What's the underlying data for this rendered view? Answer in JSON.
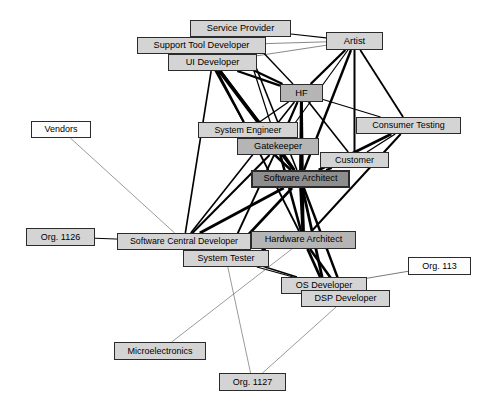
{
  "diagram": {
    "type": "node-link-network",
    "title": "",
    "width": 495,
    "height": 410,
    "background": "#ffffff",
    "styles": {
      "fill_white": "#fdfdfd",
      "fill_light_gray": "#d4d4d4",
      "fill_mid_gray": "#b5b5b5",
      "fill_dark_gray": "#8e8e8e",
      "border_color": "#2b2b2b",
      "edge_color": "#000000",
      "edge_thin_color": "#555555",
      "text_color": "#000000"
    },
    "nodes": [
      {
        "id": "service_provider",
        "label": "Service Provider",
        "x": 190,
        "y": 20,
        "w": 101,
        "h": 17,
        "fill": "#d4d4d4",
        "border": 1.6,
        "font": 9.2,
        "z": 24
      },
      {
        "id": "support_tool_dev",
        "label": "Support Tool Developer",
        "x": 137,
        "y": 37,
        "w": 129,
        "h": 17,
        "fill": "#d4d4d4",
        "border": 1.8,
        "font": 9.2,
        "z": 25
      },
      {
        "id": "artist",
        "label": "Artist",
        "x": 326,
        "y": 32,
        "w": 57,
        "h": 18,
        "fill": "#d4d4d4",
        "border": 1.8,
        "font": 9.4,
        "z": 26
      },
      {
        "id": "ui_developer",
        "label": "UI Developer",
        "x": 168,
        "y": 54,
        "w": 89,
        "h": 17,
        "fill": "#d4d4d4",
        "border": 1.8,
        "font": 9.2,
        "z": 27
      },
      {
        "id": "hf",
        "label": "HF",
        "x": 280,
        "y": 84,
        "w": 43,
        "h": 18,
        "fill": "#b5b5b5",
        "border": 1.8,
        "font": 9.4,
        "z": 28
      },
      {
        "id": "vendors",
        "label": "Vendors",
        "x": 31,
        "y": 121,
        "w": 60,
        "h": 17,
        "fill": "#fdfdfd",
        "border": 1.4,
        "font": 9.0,
        "z": 20
      },
      {
        "id": "system_engineer",
        "label": "System Engineer",
        "x": 198,
        "y": 122,
        "w": 100,
        "h": 16,
        "fill": "#d4d4d4",
        "border": 1.5,
        "font": 8.8,
        "z": 29
      },
      {
        "id": "consumer_testing",
        "label": "Consumer Testing",
        "x": 356,
        "y": 117,
        "w": 105,
        "h": 17,
        "fill": "#d4d4d4",
        "border": 1.6,
        "font": 9.0,
        "z": 30
      },
      {
        "id": "gatekeeper",
        "label": "Gatekeeper",
        "x": 237,
        "y": 138,
        "w": 82,
        "h": 17,
        "fill": "#b5b5b5",
        "border": 1.8,
        "font": 9.2,
        "z": 31
      },
      {
        "id": "customer",
        "label": "Customer",
        "x": 320,
        "y": 152,
        "w": 69,
        "h": 16,
        "fill": "#d4d4d4",
        "border": 1.5,
        "font": 9.0,
        "z": 32
      },
      {
        "id": "software_architect",
        "label": "Software Architect",
        "x": 251,
        "y": 170,
        "w": 99,
        "h": 18,
        "fill": "#8e8e8e",
        "border": 2.0,
        "font": 9.2,
        "z": 33
      },
      {
        "id": "org_1126",
        "label": "Org. 1126",
        "x": 26,
        "y": 228,
        "w": 69,
        "h": 18,
        "fill": "#d4d4d4",
        "border": 1.8,
        "font": 9.0,
        "z": 21
      },
      {
        "id": "sw_central_dev",
        "label": "Software Central Developer",
        "x": 117,
        "y": 233,
        "w": 134,
        "h": 17,
        "fill": "#d4d4d4",
        "border": 1.6,
        "font": 8.8,
        "z": 34
      },
      {
        "id": "hardware_architect",
        "label": "Hardware Architect",
        "x": 251,
        "y": 231,
        "w": 105,
        "h": 18,
        "fill": "#b5b5b5",
        "border": 1.8,
        "font": 9.2,
        "z": 35
      },
      {
        "id": "system_tester",
        "label": "System Tester",
        "x": 183,
        "y": 250,
        "w": 86,
        "h": 17,
        "fill": "#d4d4d4",
        "border": 1.6,
        "font": 9.0,
        "z": 36
      },
      {
        "id": "org_113",
        "label": "Org. 113",
        "x": 408,
        "y": 257,
        "w": 63,
        "h": 18,
        "fill": "#fdfdfd",
        "border": 1.6,
        "font": 9.0,
        "z": 22
      },
      {
        "id": "os_developer",
        "label": "OS Developer",
        "x": 281,
        "y": 277,
        "w": 86,
        "h": 17,
        "fill": "#d4d4d4",
        "border": 1.6,
        "font": 9.0,
        "z": 37
      },
      {
        "id": "dsp_developer",
        "label": "DSP Developer",
        "x": 301,
        "y": 290,
        "w": 89,
        "h": 17,
        "fill": "#d4d4d4",
        "border": 1.6,
        "font": 9.0,
        "z": 38
      },
      {
        "id": "microelectronics",
        "label": "Microelectronics",
        "x": 114,
        "y": 342,
        "w": 92,
        "h": 18,
        "fill": "#d4d4d4",
        "border": 1.6,
        "font": 9.0,
        "z": 23
      },
      {
        "id": "org_1127",
        "label": "Org. 1127",
        "x": 219,
        "y": 373,
        "w": 67,
        "h": 18,
        "fill": "#d4d4d4",
        "border": 1.8,
        "font": 9.0,
        "z": 23
      }
    ],
    "edges": [
      {
        "from": "support_tool_dev",
        "to": "artist",
        "weight": 0.7
      },
      {
        "from": "ui_developer",
        "to": "artist",
        "weight": 0.7
      },
      {
        "from": "service_provider",
        "to": "artist",
        "weight": 1.1
      },
      {
        "from": "support_tool_dev",
        "to": "hf",
        "weight": 2.2
      },
      {
        "from": "ui_developer",
        "to": "hf",
        "weight": 2.2
      },
      {
        "from": "service_provider",
        "to": "hf",
        "weight": 1.4
      },
      {
        "from": "artist",
        "to": "hf",
        "weight": 2.4
      },
      {
        "from": "artist",
        "to": "consumer_testing",
        "weight": 1.8
      },
      {
        "from": "artist",
        "to": "customer",
        "weight": 2.0
      },
      {
        "from": "artist",
        "to": "software_architect",
        "weight": 2.4
      },
      {
        "from": "artist",
        "to": "gatekeeper",
        "weight": 1.2
      },
      {
        "from": "hf",
        "to": "consumer_testing",
        "weight": 1.2
      },
      {
        "from": "hf",
        "to": "customer",
        "weight": 1.6
      },
      {
        "from": "hf",
        "to": "system_engineer",
        "weight": 1.4
      },
      {
        "from": "hf",
        "to": "gatekeeper",
        "weight": 2.2
      },
      {
        "from": "hf",
        "to": "software_architect",
        "weight": 3.0
      },
      {
        "from": "hf",
        "to": "hardware_architect",
        "weight": 2.4
      },
      {
        "from": "hf",
        "to": "sw_central_dev",
        "weight": 1.6
      },
      {
        "from": "ui_developer",
        "to": "system_engineer",
        "weight": 2.2
      },
      {
        "from": "ui_developer",
        "to": "gatekeeper",
        "weight": 2.4
      },
      {
        "from": "ui_developer",
        "to": "software_architect",
        "weight": 2.6
      },
      {
        "from": "ui_developer",
        "to": "sw_central_dev",
        "weight": 1.6
      },
      {
        "from": "support_tool_dev",
        "to": "system_engineer",
        "weight": 1.8
      },
      {
        "from": "support_tool_dev",
        "to": "gatekeeper",
        "weight": 2.0
      },
      {
        "from": "support_tool_dev",
        "to": "software_architect",
        "weight": 2.2
      },
      {
        "from": "service_provider",
        "to": "gatekeeper",
        "weight": 1.2
      },
      {
        "from": "service_provider",
        "to": "software_architect",
        "weight": 1.6
      },
      {
        "from": "system_engineer",
        "to": "gatekeeper",
        "weight": 1.6
      },
      {
        "from": "system_engineer",
        "to": "software_architect",
        "weight": 2.4
      },
      {
        "from": "system_engineer",
        "to": "hardware_architect",
        "weight": 1.8
      },
      {
        "from": "gatekeeper",
        "to": "software_architect",
        "weight": 3.0
      },
      {
        "from": "gatekeeper",
        "to": "hardware_architect",
        "weight": 2.6
      },
      {
        "from": "gatekeeper",
        "to": "sw_central_dev",
        "weight": 2.0
      },
      {
        "from": "gatekeeper",
        "to": "system_tester",
        "weight": 1.8
      },
      {
        "from": "customer",
        "to": "software_architect",
        "weight": 2.0
      },
      {
        "from": "customer",
        "to": "consumer_testing",
        "weight": 1.4
      },
      {
        "from": "consumer_testing",
        "to": "software_architect",
        "weight": 2.6
      },
      {
        "from": "consumer_testing",
        "to": "hardware_architect",
        "weight": 2.0
      },
      {
        "from": "software_architect",
        "to": "hardware_architect",
        "weight": 3.4
      },
      {
        "from": "software_architect",
        "to": "sw_central_dev",
        "weight": 3.0
      },
      {
        "from": "software_architect",
        "to": "system_tester",
        "weight": 2.6
      },
      {
        "from": "software_architect",
        "to": "os_developer",
        "weight": 2.8
      },
      {
        "from": "software_architect",
        "to": "dsp_developer",
        "weight": 2.4
      },
      {
        "from": "hardware_architect",
        "to": "sw_central_dev",
        "weight": 2.2
      },
      {
        "from": "hardware_architect",
        "to": "system_tester",
        "weight": 2.0
      },
      {
        "from": "hardware_architect",
        "to": "os_developer",
        "weight": 2.8
      },
      {
        "from": "hardware_architect",
        "to": "dsp_developer",
        "weight": 2.6
      },
      {
        "from": "sw_central_dev",
        "to": "system_tester",
        "weight": 1.6
      },
      {
        "from": "sw_central_dev",
        "to": "os_developer",
        "weight": 1.4
      },
      {
        "from": "system_tester",
        "to": "os_developer",
        "weight": 1.2
      },
      {
        "from": "os_developer",
        "to": "dsp_developer",
        "weight": 1.6
      },
      {
        "from": "vendors",
        "to": "sw_central_dev",
        "weight": 0.6
      },
      {
        "from": "org_1126",
        "to": "sw_central_dev",
        "weight": 1.0
      },
      {
        "from": "org_113",
        "to": "os_developer",
        "weight": 0.8
      },
      {
        "from": "microelectronics",
        "to": "hardware_architect",
        "weight": 0.6
      },
      {
        "from": "org_1127",
        "to": "system_tester",
        "weight": 0.6
      },
      {
        "from": "org_1127",
        "to": "dsp_developer",
        "weight": 0.6
      }
    ]
  }
}
